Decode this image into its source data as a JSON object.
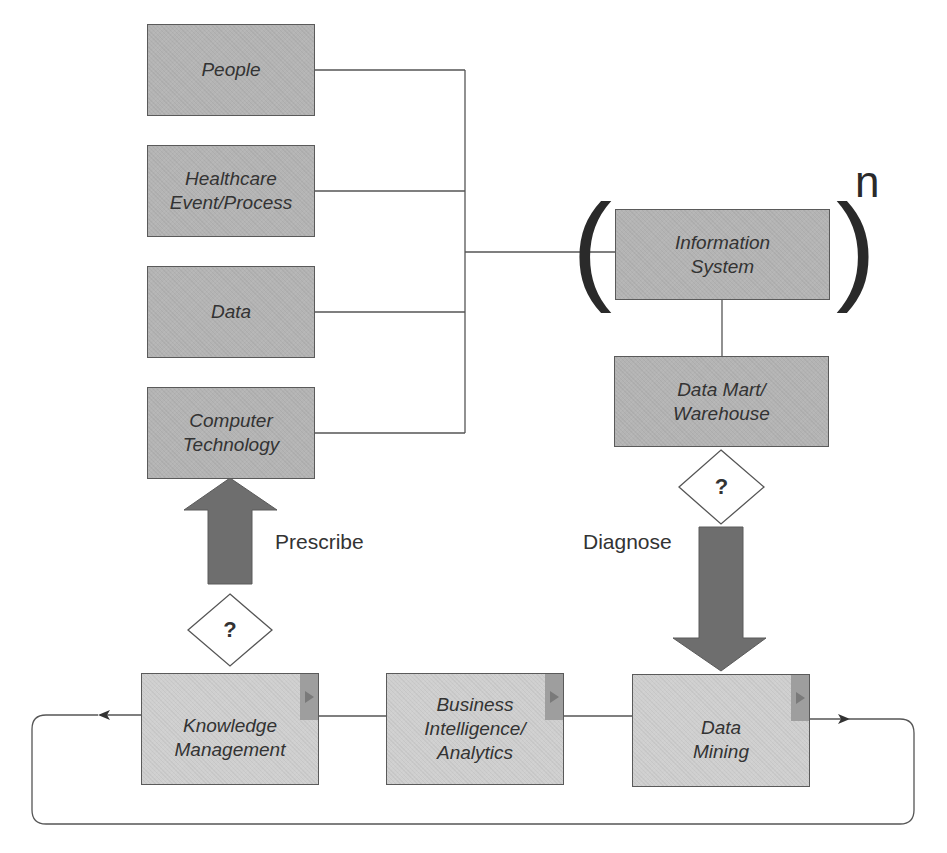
{
  "diagram": {
    "title": "",
    "colors": {
      "box_fill": "#b4b4b4",
      "box_fill_light": "#cfcfcf",
      "box_border": "#5a5a5a",
      "arrow_fill": "#6e6e6e",
      "line": "#555555",
      "text": "#333333"
    },
    "inputs": [
      {
        "id": "people",
        "lines": [
          "People"
        ]
      },
      {
        "id": "healthcare",
        "lines": [
          "Healthcare",
          "Event/Process"
        ]
      },
      {
        "id": "data",
        "lines": [
          "Data"
        ]
      },
      {
        "id": "computer_tech",
        "lines": [
          "Computer",
          "Technology"
        ]
      }
    ],
    "information_system": {
      "lines": [
        "Information",
        "System"
      ],
      "paren_open": "(",
      "paren_close": ")",
      "exponent": "n"
    },
    "data_mart": {
      "lines": [
        "Data Mart/",
        "Warehouse"
      ]
    },
    "decision_symbol": "?",
    "arrows": {
      "prescribe": "Prescribe",
      "diagnose": "Diagnose"
    },
    "cycle": [
      {
        "id": "knowledge_management",
        "lines": [
          "Knowledge",
          "Management"
        ]
      },
      {
        "id": "business_intelligence",
        "lines": [
          "Business",
          "Intelligence/",
          "Analytics"
        ]
      },
      {
        "id": "data_mining",
        "lines": [
          "Data",
          "Mining"
        ]
      }
    ]
  }
}
